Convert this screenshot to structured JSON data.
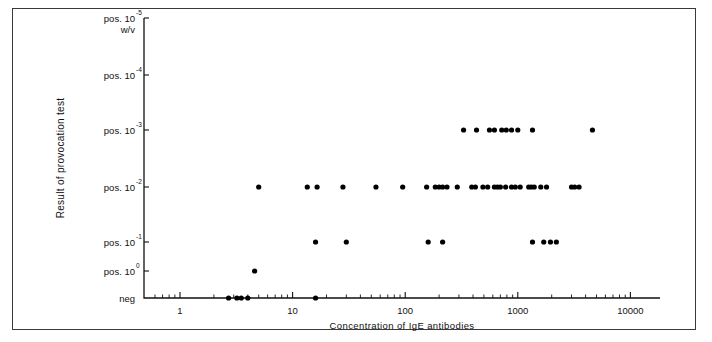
{
  "figure": {
    "background_color": "#ffffff",
    "frame_color": "#3a3a3a",
    "point_color": "#000000"
  },
  "axes": {
    "y_axis_title": "Result of provocation test",
    "x_axis_title": "Concentration of IgE antibodies",
    "y_categories": [
      {
        "prefix": "pos. 10",
        "exp": "-5",
        "sub": "w/v",
        "value": 6
      },
      {
        "prefix": "pos. 10",
        "exp": "-4",
        "sub": "",
        "value": 5
      },
      {
        "prefix": "pos. 10",
        "exp": "-3",
        "sub": "",
        "value": 4
      },
      {
        "prefix": "pos. 10",
        "exp": "-2",
        "sub": "",
        "value": 3
      },
      {
        "prefix": "pos. 10",
        "exp": "-1",
        "sub": "",
        "value": 2
      },
      {
        "prefix": "pos. 10",
        "exp": "0",
        "sub": "",
        "value": 1
      },
      {
        "prefix": "neg",
        "exp": "",
        "sub": "",
        "value": 0
      }
    ],
    "x_tick_labels": [
      "1",
      "10",
      "100",
      "1000",
      "10000"
    ],
    "x_scale": "log10",
    "x_range": [
      0.55,
      13000
    ],
    "grid": "off",
    "legend": "none"
  },
  "chart_data": {
    "type": "scatter",
    "title": "",
    "subtitle": "",
    "xlabel": "Concentration of IgE antibodies",
    "ylabel": "Result of provocation test",
    "xscale": "log",
    "xlim": [
      0.55,
      13000
    ],
    "ycategories": [
      "neg",
      "pos. 10^0",
      "pos. 10^-1",
      "pos. 10^-2",
      "pos. 10^-3",
      "pos. 10^-4",
      "pos. 10^-5 w/v"
    ],
    "grid": false,
    "legend_position": "none",
    "series": [
      {
        "name": "patients",
        "points": [
          {
            "x": 2.7,
            "y": "neg"
          },
          {
            "x": 3.2,
            "y": "neg"
          },
          {
            "x": 3.5,
            "y": "neg"
          },
          {
            "x": 4.0,
            "y": "neg"
          },
          {
            "x": 16.0,
            "y": "neg"
          },
          {
            "x": 4.6,
            "y": "pos. 10^0"
          },
          {
            "x": 16.0,
            "y": "pos. 10^-1"
          },
          {
            "x": 30.0,
            "y": "pos. 10^-1"
          },
          {
            "x": 160.0,
            "y": "pos. 10^-1"
          },
          {
            "x": 215.0,
            "y": "pos. 10^-1"
          },
          {
            "x": 1350.0,
            "y": "pos. 10^-1"
          },
          {
            "x": 1700.0,
            "y": "pos. 10^-1"
          },
          {
            "x": 1950.0,
            "y": "pos. 10^-1"
          },
          {
            "x": 2200.0,
            "y": "pos. 10^-1"
          },
          {
            "x": 5.0,
            "y": "pos. 10^-2"
          },
          {
            "x": 13.5,
            "y": "pos. 10^-2"
          },
          {
            "x": 16.5,
            "y": "pos. 10^-2"
          },
          {
            "x": 28.0,
            "y": "pos. 10^-2"
          },
          {
            "x": 55.0,
            "y": "pos. 10^-2"
          },
          {
            "x": 95.0,
            "y": "pos. 10^-2"
          },
          {
            "x": 155.0,
            "y": "pos. 10^-2"
          },
          {
            "x": 185.0,
            "y": "pos. 10^-2"
          },
          {
            "x": 200.0,
            "y": "pos. 10^-2"
          },
          {
            "x": 215.0,
            "y": "pos. 10^-2"
          },
          {
            "x": 235.0,
            "y": "pos. 10^-2"
          },
          {
            "x": 290.0,
            "y": "pos. 10^-2"
          },
          {
            "x": 390.0,
            "y": "pos. 10^-2"
          },
          {
            "x": 420.0,
            "y": "pos. 10^-2"
          },
          {
            "x": 490.0,
            "y": "pos. 10^-2"
          },
          {
            "x": 540.0,
            "y": "pos. 10^-2"
          },
          {
            "x": 620.0,
            "y": "pos. 10^-2"
          },
          {
            "x": 660.0,
            "y": "pos. 10^-2"
          },
          {
            "x": 700.0,
            "y": "pos. 10^-2"
          },
          {
            "x": 780.0,
            "y": "pos. 10^-2"
          },
          {
            "x": 880.0,
            "y": "pos. 10^-2"
          },
          {
            "x": 950.0,
            "y": "pos. 10^-2"
          },
          {
            "x": 1050.0,
            "y": "pos. 10^-2"
          },
          {
            "x": 1250.0,
            "y": "pos. 10^-2"
          },
          {
            "x": 1320.0,
            "y": "pos. 10^-2"
          },
          {
            "x": 1400.0,
            "y": "pos. 10^-2"
          },
          {
            "x": 1600.0,
            "y": "pos. 10^-2"
          },
          {
            "x": 1800.0,
            "y": "pos. 10^-2"
          },
          {
            "x": 3000.0,
            "y": "pos. 10^-2"
          },
          {
            "x": 3200.0,
            "y": "pos. 10^-2"
          },
          {
            "x": 3500.0,
            "y": "pos. 10^-2"
          },
          {
            "x": 330.0,
            "y": "pos. 10^-3"
          },
          {
            "x": 430.0,
            "y": "pos. 10^-3"
          },
          {
            "x": 560.0,
            "y": "pos. 10^-3"
          },
          {
            "x": 620.0,
            "y": "pos. 10^-3"
          },
          {
            "x": 720.0,
            "y": "pos. 10^-3"
          },
          {
            "x": 790.0,
            "y": "pos. 10^-3"
          },
          {
            "x": 880.0,
            "y": "pos. 10^-3"
          },
          {
            "x": 1000.0,
            "y": "pos. 10^-3"
          },
          {
            "x": 1350.0,
            "y": "pos. 10^-3"
          },
          {
            "x": 4600.0,
            "y": "pos. 10^-3"
          }
        ]
      }
    ]
  }
}
